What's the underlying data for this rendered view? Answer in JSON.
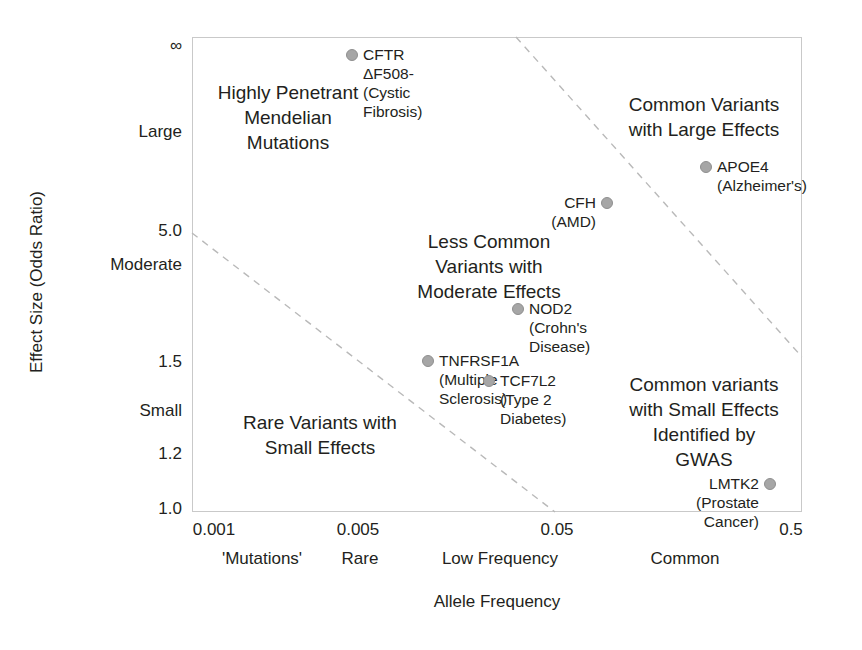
{
  "chart_data": {
    "type": "scatter",
    "title": "",
    "xlabel": "Allele Frequency",
    "ylabel": "Effect Size (Odds Ratio)",
    "grid": false,
    "legend": "none",
    "x_scale": "log",
    "x_ticks": [
      "0.001",
      "0.005",
      "0.05",
      "0.5"
    ],
    "x_tick_positions_px": [
      192,
      340,
      555,
      802
    ],
    "x_categories": [
      "'Mutations'",
      "Rare",
      "Low Frequency",
      "Common"
    ],
    "x_category_positions_px": [
      262,
      360,
      500,
      685
    ],
    "y_ticks": [
      "∞",
      "Large",
      "5.0",
      "Moderate",
      "1.5",
      "Small",
      "1.2",
      "1.0"
    ],
    "y_tick_positions_px": [
      47,
      133,
      232,
      266,
      363,
      412,
      455,
      510
    ],
    "points": [
      {
        "name": "CFTR ΔF508-(Cystic Fibrosis)",
        "gene": "CFTR ΔF508",
        "trait": "Cystic Fibrosis",
        "x_px": 352,
        "y_px": 55,
        "allele_frequency": 0.0055,
        "odds_ratio": "∞",
        "label_side": "right"
      },
      {
        "name": "APOE4 (Alzheimer's)",
        "gene": "APOE4",
        "trait": "Alzheimer's",
        "x_px": 706,
        "y_px": 167,
        "allele_frequency": 0.13,
        "odds_ratio": 8,
        "label_side": "right"
      },
      {
        "name": "CFH (AMD)",
        "gene": "CFH",
        "trait": "AMD",
        "x_px": 607,
        "y_px": 203,
        "allele_frequency": 0.07,
        "odds_ratio": 6,
        "label_side": "left"
      },
      {
        "name": "NOD2 (Crohn's Disease)",
        "gene": "NOD2",
        "trait": "Crohn's Disease",
        "x_px": 518,
        "y_px": 309,
        "allele_frequency": 0.035,
        "odds_ratio": 3,
        "label_side": "right"
      },
      {
        "name": "TNFRSF1A (Multiple Sclerosis)",
        "gene": "TNFRSF1A",
        "trait": "Multiple Sclerosis",
        "x_px": 428,
        "y_px": 361,
        "allele_frequency": 0.012,
        "odds_ratio": 1.55,
        "label_side": "right"
      },
      {
        "name": "TCF7L2\n(Type 2 Diabetes)",
        "gene": "TCF7L2",
        "trait": "Type 2 Diabetes",
        "x_px": 489,
        "y_px": 381,
        "allele_frequency": 0.03,
        "odds_ratio": 1.4,
        "label_side": "right"
      },
      {
        "name": "LMTK2 (Prostate Cancer)",
        "gene": "LMTK2",
        "trait": "Prostate Cancer",
        "x_px": 770,
        "y_px": 484,
        "allele_frequency": 0.4,
        "odds_ratio": 1.1,
        "label_side": "left"
      }
    ],
    "regions": [
      {
        "id": "highly-penetrant-mendelian-mutations",
        "text": "Highly Penetrant\nMendelian\nMutations",
        "x_px": 288,
        "y_px": 80
      },
      {
        "id": "common-variants-with-large-effects",
        "text": "Common Variants\nwith Large Effects",
        "x_px": 704,
        "y_px": 92
      },
      {
        "id": "less-common-variants-with-moderate-effects",
        "text": "Less Common\nVariants with\nModerate Effects",
        "x_px": 489,
        "y_px": 229
      },
      {
        "id": "rare-variants-with-small-effects",
        "text": "Rare Variants with\nSmall Effects",
        "x_px": 320,
        "y_px": 410
      },
      {
        "id": "common-variants-with-small-effects-gwas",
        "text": "Common variants\nwith Small Effects\nIdentified by\nGWAS",
        "x_px": 704,
        "y_px": 372
      }
    ],
    "boundary_lines": [
      {
        "id": "upper-boundary",
        "style": "dashed",
        "x1_px": 516,
        "y1_px": 37,
        "x2_px": 802,
        "y2_px": 357
      },
      {
        "id": "lower-boundary",
        "style": "dashed",
        "x1_px": 192,
        "y1_px": 233,
        "x2_px": 555,
        "y2_px": 512
      }
    ],
    "plot_area_px": {
      "left": 192,
      "top": 37,
      "width": 610,
      "height": 475
    }
  },
  "colors": {
    "background": "#ffffff",
    "text": "#231f20",
    "marker_fill": "#a6a6a6",
    "marker_stroke": "#8f8f8f",
    "frame": "#c9c9c9",
    "dashed_line": "#b9b9b9"
  }
}
